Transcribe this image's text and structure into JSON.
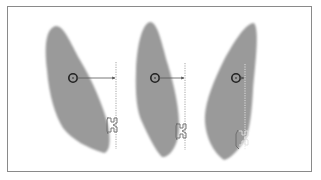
{
  "figure": {
    "colors": {
      "frame_border": "#8a8a8a",
      "tooth_fill": "#9a9a9a",
      "marker_stroke": "#222222",
      "arrow_line": "#555555",
      "dashed_line": "#9c9c9c",
      "bracket_stroke": "#6a6a6a"
    },
    "teeth": [
      {
        "id": "tooth-1",
        "center_of_resistance": [
          73,
          78
        ],
        "arrow_end_x": 115,
        "bracket_line_x": 116
      },
      {
        "id": "tooth-2",
        "center_of_resistance": [
          155,
          78
        ],
        "arrow_end_x": 184,
        "bracket_line_x": 185
      },
      {
        "id": "tooth-3",
        "center_of_resistance": [
          236,
          78
        ],
        "arrow_end_x": 244,
        "bracket_line_x": 245
      }
    ]
  }
}
